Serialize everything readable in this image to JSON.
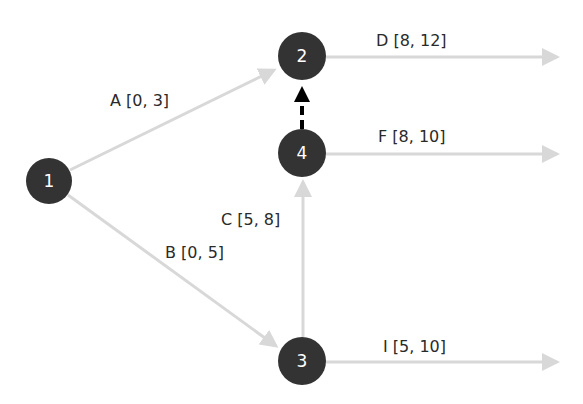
{
  "diagram": {
    "type": "activity-on-arrow network",
    "nodes": [
      {
        "id": "1",
        "label": "1",
        "cx": 49,
        "cy": 181
      },
      {
        "id": "2",
        "label": "2",
        "cx": 302,
        "cy": 56
      },
      {
        "id": "4",
        "label": "4",
        "cx": 302,
        "cy": 153
      },
      {
        "id": "3",
        "label": "3",
        "cx": 302,
        "cy": 361
      }
    ],
    "activities": [
      {
        "name": "A",
        "range": "[0, 3]",
        "text": "A [0, 3]",
        "from": "1",
        "to": "2"
      },
      {
        "name": "B",
        "range": "[0, 5]",
        "text": "B [0, 5]",
        "from": "1",
        "to": "3"
      },
      {
        "name": "C",
        "range": "[5, 8]",
        "text": "C [5, 8]",
        "from": "3",
        "to": "4"
      },
      {
        "name": "D",
        "range": "[8, 12]",
        "text": "D [8, 12]",
        "from": "2",
        "to": "out"
      },
      {
        "name": "F",
        "range": "[8, 10]",
        "text": "F [8, 10]",
        "from": "4",
        "to": "out"
      },
      {
        "name": "I",
        "range": "[5, 10]",
        "text": "I [5, 10]",
        "from": "3",
        "to": "out"
      }
    ],
    "dummy": {
      "from": "4",
      "to": "2",
      "style": "dashed-black"
    },
    "colors": {
      "node_fill": "#333333",
      "node_text": "#ffffff",
      "edge": "#d8d8d8",
      "dummy_edge": "#000000",
      "label_text": "#2a2a2a"
    }
  }
}
